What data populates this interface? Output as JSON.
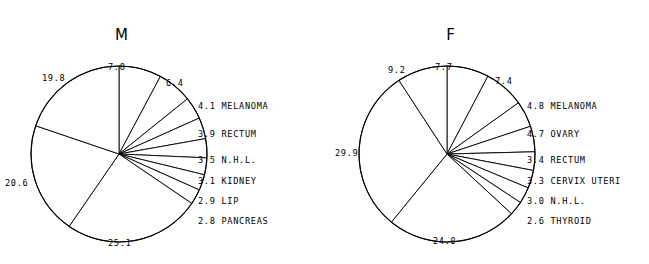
{
  "figure": {
    "background": "#ffffff",
    "ink": "#000000"
  },
  "chart_data": [
    {
      "type": "pie",
      "title": "M",
      "xlabel": "",
      "ylabel": "",
      "units": "percent",
      "legend_position": "right",
      "grid": false,
      "categories": [
        "7.8 slice",
        "6.4 slice",
        "MELANOMA",
        "RECTUM",
        "N.H.L.",
        "KIDNEY",
        "LIP",
        "PANCREAS",
        "25.1 slice",
        "20.6 slice",
        "19.8 slice"
      ],
      "values": [
        7.8,
        6.4,
        4.1,
        3.9,
        3.5,
        3.1,
        2.9,
        2.8,
        25.1,
        20.6,
        19.8
      ],
      "outer_labels": [
        {
          "text": "7.8",
          "slice_index": 0
        },
        {
          "text": "6.4",
          "slice_index": 1
        },
        {
          "text": "25.1",
          "slice_index": 8
        },
        {
          "text": "20.6",
          "slice_index": 9
        },
        {
          "text": "19.8",
          "slice_index": 10
        }
      ],
      "legend": [
        {
          "value": "4.1",
          "label": "MELANOMA"
        },
        {
          "value": "3.9",
          "label": "RECTUM"
        },
        {
          "value": "3.5",
          "label": "N.H.L."
        },
        {
          "value": "3.1",
          "label": "KIDNEY"
        },
        {
          "value": "2.9",
          "label": "LIP"
        },
        {
          "value": "2.8",
          "label": "PANCREAS"
        }
      ],
      "total": 100.0
    },
    {
      "type": "pie",
      "title": "F",
      "xlabel": "",
      "ylabel": "",
      "units": "percent",
      "legend_position": "right",
      "grid": false,
      "categories": [
        "7.7 slice",
        "7.4 slice",
        "MELANOMA",
        "OVARY",
        "RECTUM",
        "CERVIX UTERI",
        "N.H.L.",
        "THYROID",
        "24.0 slice",
        "29.9 slice",
        "9.2 slice"
      ],
      "values": [
        7.7,
        7.4,
        4.8,
        4.7,
        3.4,
        3.3,
        3.0,
        2.6,
        24.0,
        29.9,
        9.2
      ],
      "outer_labels": [
        {
          "text": "7.7",
          "slice_index": 0
        },
        {
          "text": "7.4",
          "slice_index": 1
        },
        {
          "text": "24.0",
          "slice_index": 8
        },
        {
          "text": "29.9",
          "slice_index": 9
        },
        {
          "text": "9.2",
          "slice_index": 10
        }
      ],
      "legend": [
        {
          "value": "4.8",
          "label": "MELANOMA"
        },
        {
          "value": "4.7",
          "label": "OVARY"
        },
        {
          "value": "3.4",
          "label": "RECTUM"
        },
        {
          "value": "3.3",
          "label": "CERVIX UTERI"
        },
        {
          "value": "3.0",
          "label": "N.H.L."
        },
        {
          "value": "2.6",
          "label": "THYROID"
        }
      ],
      "total": 100.0
    }
  ],
  "panel_m": {
    "title": "M",
    "outer": {
      "top": "7.8",
      "upper_right": "6.4",
      "upper_left": "19.8",
      "left": "20.6",
      "bottom": "25.1"
    },
    "legend": [
      {
        "value": "4.1",
        "label": "MELANOMA"
      },
      {
        "value": "3.9",
        "label": "RECTUM"
      },
      {
        "value": "3.5",
        "label": "N.H.L."
      },
      {
        "value": "3.1",
        "label": "KIDNEY"
      },
      {
        "value": "2.9",
        "label": "LIP"
      },
      {
        "value": "2.8",
        "label": "PANCREAS"
      }
    ]
  },
  "panel_f": {
    "title": "F",
    "outer": {
      "top": "7.7",
      "upper_right": "7.4",
      "upper_left": "9.2",
      "left": "29.9",
      "bottom": "24.0"
    },
    "legend": [
      {
        "value": "4.8",
        "label": "MELANOMA"
      },
      {
        "value": "4.7",
        "label": "OVARY"
      },
      {
        "value": "3.4",
        "label": "RECTUM"
      },
      {
        "value": "3.3",
        "label": "CERVIX UTERI"
      },
      {
        "value": "3.0",
        "label": "N.H.L."
      },
      {
        "value": "2.6",
        "label": "THYROID"
      }
    ]
  }
}
